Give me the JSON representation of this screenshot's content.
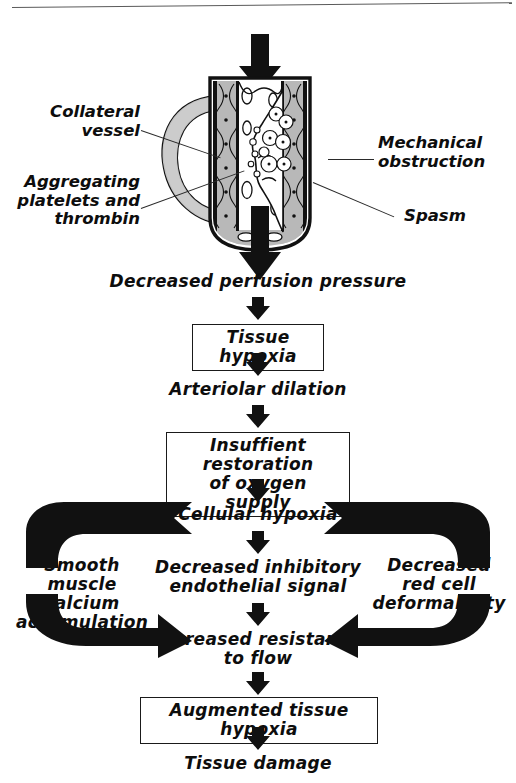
{
  "figure": {
    "title_rule": "horizontal-rule",
    "illustration": {
      "name": "occluded-artery-cross-section",
      "inflow_arrow": "down-arrow-inflow",
      "outflow_arrow": "down-arrow-outflow",
      "colors": {
        "vessel_wall": "#1a1a1a",
        "collateral_fill": "#c9c9c9",
        "lumen": "#ffffff",
        "media_shading": "#b4b4b4"
      }
    },
    "callouts": [
      {
        "id": "collateral-vessel",
        "text": "Collateral\nvessel",
        "side": "left"
      },
      {
        "id": "aggregating-platelets",
        "text": "Aggregating\nplatelets and\nthrombin",
        "side": "left"
      },
      {
        "id": "mechanical-obstruction",
        "text": "Mechanical\nobstruction",
        "side": "right"
      },
      {
        "id": "spasm",
        "text": "Spasm",
        "side": "right"
      }
    ],
    "flow": {
      "nodes": [
        {
          "id": "decreased-perfusion-pressure",
          "text": "Decreased  perfusion pressure",
          "boxed": false
        },
        {
          "id": "tissue-hypoxia",
          "text": "Tissue  hypoxia",
          "boxed": true
        },
        {
          "id": "arteriolar-dilation",
          "text": "Arteriolar  dilation",
          "boxed": false
        },
        {
          "id": "insufficient-restoration",
          "text": "Insuffient restoration\nof  oxygen supply",
          "boxed": true
        },
        {
          "id": "cellular-hypoxia",
          "text": "Cellular  hypoxia",
          "boxed": false
        },
        {
          "id": "decreased-inhibitory-endothelial-signal",
          "text": "Decreased inhibitory\nendothelial signal",
          "boxed": false
        },
        {
          "id": "increased-resistance-to-flow",
          "text": "Increased  resistance\nto flow",
          "boxed": false
        },
        {
          "id": "augmented-tissue-hypoxia",
          "text": "Augmented  tissue hypoxia",
          "boxed": true
        },
        {
          "id": "tissue-damage",
          "text": "Tissue  damage",
          "boxed": false
        }
      ],
      "side_nodes": [
        {
          "id": "smooth-muscle-calcium-accumulation",
          "text": "Smooth muscle\ncalcium\naccumulation",
          "side": "left"
        },
        {
          "id": "decreased-red-cell-deformability",
          "text": "Decreased\nred cell\ndeformability",
          "side": "right"
        }
      ],
      "loops": [
        {
          "id": "left-feedback-loop",
          "from": "cellular-hypoxia",
          "through": "smooth-muscle-calcium-accumulation",
          "to": "increased-resistance-to-flow"
        },
        {
          "id": "right-feedback-loop",
          "from": "cellular-hypoxia",
          "through": "decreased-red-cell-deformability",
          "to": "increased-resistance-to-flow"
        }
      ],
      "arrow_color": "#111111"
    }
  }
}
